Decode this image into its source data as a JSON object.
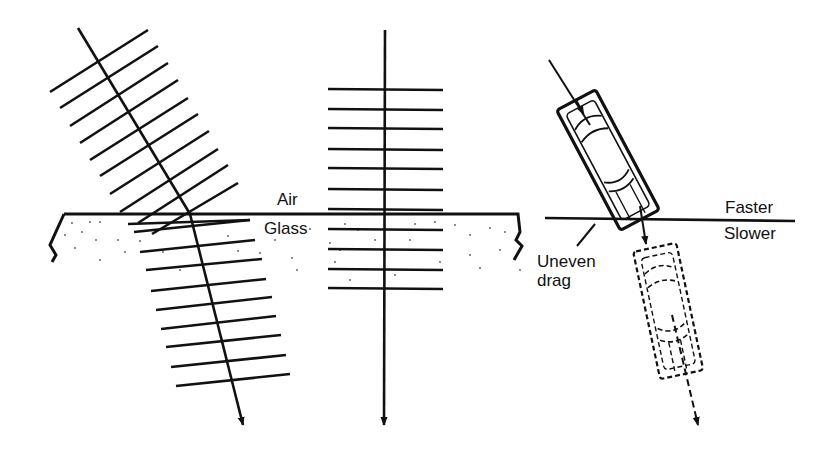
{
  "figure": {
    "panels": [
      {
        "id": "oblique",
        "description": "Oblique wavefronts bend toward normal entering glass"
      },
      {
        "id": "normal",
        "description": "Normal incidence: wavefronts closer together in glass, no bending"
      },
      {
        "id": "car-analogy",
        "description": "Car crossing from faster to slower surface turns due to uneven drag"
      }
    ]
  },
  "labels": {
    "air": "Air",
    "glass": "Glass",
    "faster": "Faster",
    "slower": "Slower",
    "uneven_drag_line1": "Uneven",
    "uneven_drag_line2": "drag"
  },
  "colors": {
    "ink": "#111111",
    "background": "#ffffff"
  }
}
